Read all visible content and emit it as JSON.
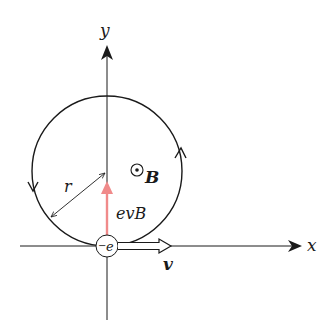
{
  "diagram": {
    "axes": {
      "x_label": "x",
      "y_label": "y"
    },
    "labels": {
      "magnetic_field": "B",
      "force": "evB",
      "radius": "r",
      "velocity": "v",
      "charge": "e",
      "charge_sign": "−"
    },
    "colors": {
      "line": "#1a1a1a",
      "force_arrow": "#f08a8a",
      "background": "#ffffff"
    },
    "geometry": {
      "circle_center": [
        107,
        171
      ],
      "circle_radius": 75,
      "electron_position": [
        107,
        246
      ],
      "direction": "counterclockwise"
    }
  }
}
